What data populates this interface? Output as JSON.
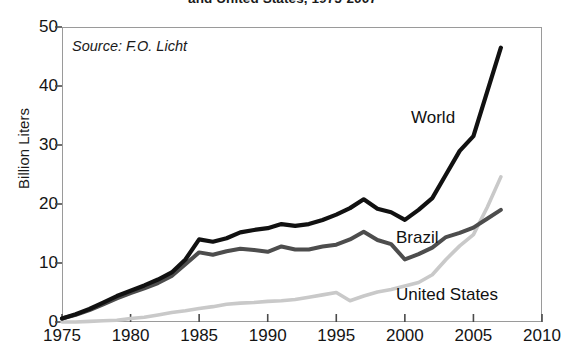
{
  "chart_data": {
    "type": "line",
    "title": "and United States, 1975-2007",
    "subtitle": "",
    "xlabel": "",
    "ylabel": "Billion Liters",
    "xlim": [
      1975,
      2010
    ],
    "ylim": [
      0,
      50
    ],
    "xticks": [
      "1975",
      "1980",
      "1985",
      "1990",
      "1995",
      "2000",
      "2005",
      "2010"
    ],
    "yticks": [
      "0",
      "10",
      "20",
      "30",
      "40",
      "50"
    ],
    "grid": false,
    "legend_position": "inline-annotations",
    "annotations": [
      {
        "name": "source",
        "text": "Source: F.O. Licht"
      }
    ],
    "x": [
      1975,
      1976,
      1977,
      1978,
      1979,
      1980,
      1981,
      1982,
      1983,
      1984,
      1985,
      1986,
      1987,
      1988,
      1989,
      1990,
      1991,
      1992,
      1993,
      1994,
      1995,
      1996,
      1997,
      1998,
      1999,
      2000,
      2001,
      2002,
      2003,
      2004,
      2005,
      2006,
      2007
    ],
    "series": [
      {
        "name": "World",
        "color": "#111111",
        "width": 4.2,
        "values": [
          0.6,
          1.3,
          2.2,
          3.3,
          4.4,
          5.3,
          6.2,
          7.2,
          8.4,
          10.6,
          14.0,
          13.6,
          14.2,
          15.2,
          15.6,
          15.9,
          16.6,
          16.3,
          16.6,
          17.3,
          18.2,
          19.3,
          20.8,
          19.2,
          18.6,
          17.3,
          19.0,
          21.0,
          25.0,
          29.0,
          31.5,
          39.0,
          46.5
        ]
      },
      {
        "name": "Brazil",
        "color": "#4d4d4d",
        "width": 4.0,
        "values": [
          0.6,
          1.2,
          2.0,
          3.0,
          4.0,
          4.9,
          5.7,
          6.6,
          7.8,
          9.8,
          11.8,
          11.4,
          12.0,
          12.4,
          12.2,
          11.9,
          12.8,
          12.3,
          12.3,
          12.8,
          13.1,
          14.0,
          15.3,
          13.9,
          13.2,
          10.6,
          11.5,
          12.6,
          14.4,
          15.1,
          16.0,
          17.5,
          19.0
        ]
      },
      {
        "name": "United States",
        "color": "#c9c9c9",
        "width": 3.6,
        "values": [
          0.0,
          0.0,
          0.1,
          0.2,
          0.3,
          0.6,
          0.8,
          1.2,
          1.6,
          1.9,
          2.3,
          2.6,
          3.0,
          3.2,
          3.3,
          3.5,
          3.6,
          3.8,
          4.2,
          4.6,
          5.0,
          3.6,
          4.4,
          5.1,
          5.5,
          6.1,
          6.7,
          8.0,
          10.6,
          12.9,
          14.8,
          19.4,
          24.6
        ]
      }
    ],
    "series_labels": {
      "world": "World",
      "brazil": "Brazil",
      "united_states": "United States"
    }
  },
  "axis": {
    "y_title": "Billion Liters"
  }
}
